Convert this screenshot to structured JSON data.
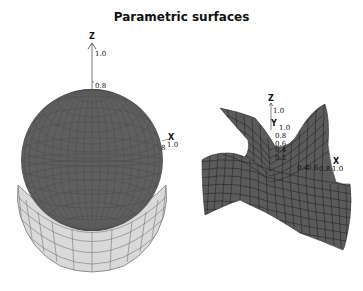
{
  "title": "Parametric surfaces",
  "left_plot": {
    "name": "sphere-with-collar",
    "z_axis": {
      "label": "Z",
      "ticks": [
        "1.0",
        "0.8"
      ]
    },
    "x_axis": {
      "label": "X",
      "ticks": [
        "8",
        "1.0"
      ]
    },
    "colors": {
      "sphere": "#5e5e5e",
      "collar": "#d8d8d8",
      "mesh": "#3a3a3a"
    }
  },
  "right_plot": {
    "name": "saddle-surface",
    "z_axis": {
      "label": "Z",
      "ticks": [
        "1.0",
        "0.8",
        "0.6",
        "0.4",
        "0.2"
      ]
    },
    "y_axis": {
      "label": "Y",
      "ticks": [
        "1.0"
      ]
    },
    "x_axis": {
      "label": "X",
      "ticks": [
        "0.4",
        "0.6",
        "0.8",
        "1.0"
      ]
    },
    "colors": {
      "surface": "#5a5a5a",
      "mesh": "#222222"
    }
  }
}
